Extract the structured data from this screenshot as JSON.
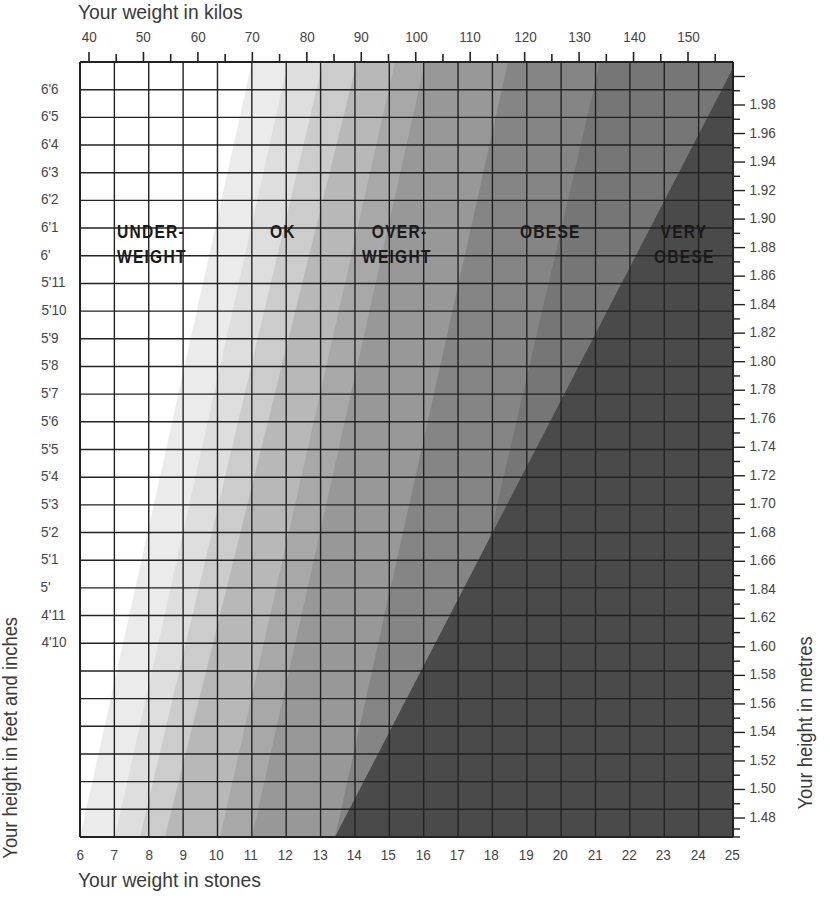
{
  "chart_data": {
    "type": "heatmap",
    "top_axis": {
      "label": "Your weight in kilos",
      "ticks": [
        "40",
        "50",
        "60",
        "70",
        "80",
        "90",
        "100",
        "110",
        "120",
        "130",
        "140",
        "150"
      ]
    },
    "bottom_axis": {
      "label": "Your weight in stones",
      "ticks": [
        "6",
        "7",
        "8",
        "9",
        "10",
        "11",
        "12",
        "13",
        "14",
        "15",
        "16",
        "17",
        "18",
        "19",
        "20",
        "21",
        "22",
        "23",
        "24",
        "25"
      ]
    },
    "left_axis": {
      "label": "Your height in feet and inches",
      "ticks": [
        "6'6",
        "6'5",
        "6'4",
        "6'3",
        "6'2",
        "6'1",
        "6'",
        "5'11",
        "5'10",
        "5'9",
        "5'8",
        "5'7",
        "5'6",
        "5'5",
        "5'4",
        "5'3",
        "5'2",
        "5'1",
        "5'",
        "4'11",
        "4'10"
      ]
    },
    "right_axis": {
      "label": "Your height in metres",
      "ticks": [
        "1.98",
        "1.96",
        "1.94",
        "1.92",
        "1.90",
        "1.88",
        "1.86",
        "1.84",
        "1.82",
        "1.80",
        "1.78",
        "1.76",
        "1.74",
        "1.72",
        "1.70",
        "1.68",
        "1.66",
        "1.84",
        "1.62",
        "1.60",
        "1.58",
        "1.56",
        "1.54",
        "1.52",
        "1.50",
        "1.48"
      ]
    },
    "zones": [
      {
        "name": "UNDERWEIGHT",
        "line1": "UNDER-",
        "line2": "WEIGHT",
        "color": "#ffffff"
      },
      {
        "name": "OK",
        "line1": "OK",
        "line2": "",
        "color": "#d9d9d9"
      },
      {
        "name": "OVERWEIGHT",
        "line1": "OVER-",
        "line2": "WEIGHT",
        "color": "#a9a9a9"
      },
      {
        "name": "OBESE",
        "line1": "OBESE",
        "line2": "",
        "color": "#777777"
      },
      {
        "name": "VERY OBESE",
        "line1": "VERY",
        "line2": "OBESE",
        "color": "#474747"
      }
    ],
    "bands": [
      {
        "color": "#ebebeb",
        "top_x": 252,
        "bottom_x": 80
      },
      {
        "color": "#dedede",
        "top_x": 288,
        "bottom_x": 115
      },
      {
        "color": "#cccccc",
        "top_x": 323,
        "bottom_x": 140
      },
      {
        "color": "#b8b8b8",
        "top_x": 357,
        "bottom_x": 165
      },
      {
        "color": "#a8a8a8",
        "top_x": 395,
        "bottom_x": 220
      },
      {
        "color": "#989898",
        "top_x": 425,
        "bottom_x": 252
      },
      {
        "color": "#858585",
        "top_x": 508,
        "bottom_x": 335
      },
      {
        "color": "#767676",
        "top_x": 600,
        "bottom_x": 420
      },
      {
        "color": "#4a4a4a",
        "top_x": 733,
        "bottom_x": 335
      }
    ],
    "grid": true
  }
}
